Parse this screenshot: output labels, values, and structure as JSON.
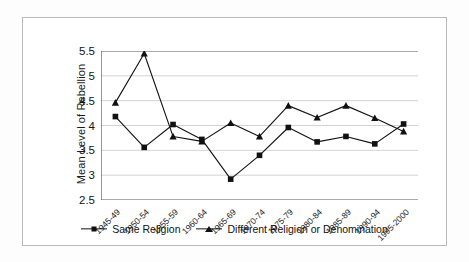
{
  "chart_data": {
    "type": "line",
    "title": "",
    "xlabel": "",
    "ylabel": "Mean Level of Rebellion",
    "ylim": [
      2.5,
      5.5
    ],
    "yticks": [
      2.5,
      3,
      3.5,
      4,
      4.5,
      5,
      5.5
    ],
    "ytick_labels": [
      "2.5",
      "3",
      "3.5",
      "4",
      "4.5",
      "5",
      "5.5"
    ],
    "grid": true,
    "grid_axis": "y",
    "legend_position": "bottom",
    "categories": [
      "1945-49",
      "1950-54",
      "1955-59",
      "1960-64",
      "1965-69",
      "1970-74",
      "1975-79",
      "1980-84",
      "1985-89",
      "1990-94",
      "1995-2000"
    ],
    "series": [
      {
        "name": "Same Religion",
        "marker": "square",
        "color": "#111111",
        "values": [
          4.18,
          3.56,
          4.02,
          3.72,
          2.92,
          3.4,
          3.96,
          3.67,
          3.78,
          3.63,
          4.03
        ]
      },
      {
        "name": "Different Religion or Denomination",
        "marker": "triangle",
        "color": "#111111",
        "values": [
          4.46,
          5.45,
          3.78,
          3.68,
          4.05,
          3.78,
          4.4,
          4.16,
          4.4,
          4.15,
          3.88
        ]
      }
    ]
  },
  "legend": {
    "entries": [
      {
        "label": "Same Religion"
      },
      {
        "label": "Different Religion or Denomination"
      }
    ]
  },
  "colors": {
    "line": "#111111",
    "grid": "#c8c8c8",
    "axis": "#555555",
    "frame": "#b9b9b9",
    "background": "#ffffff"
  }
}
